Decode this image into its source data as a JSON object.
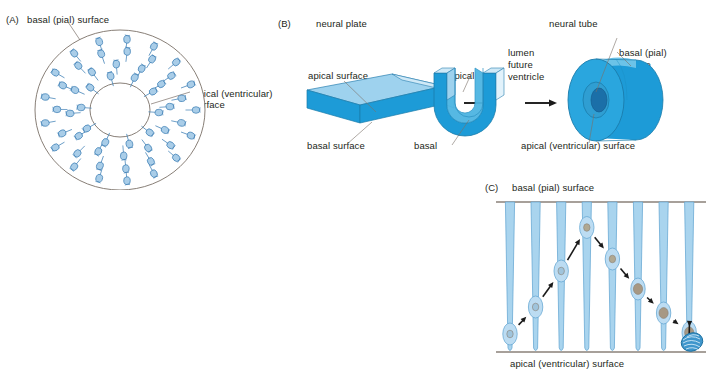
{
  "figure": {
    "background": "#ffffff",
    "width": 714,
    "height": 380
  },
  "colors": {
    "cell_fill": "#a9cde8",
    "cell_stroke": "#3e7fb5",
    "outline_gray": "#7b7068",
    "block_top": "#9ed2ee",
    "block_front": "#1d9bd7",
    "block_side": "#d8ecf8",
    "tube_body": "#1d9bd7",
    "tube_face": "#2aa6de",
    "tube_top": "#6cc3e8",
    "lumen_dark": "#1b6fa8",
    "fiber_fill": "#a9d4ee",
    "fiber_stroke": "#6aa9d4",
    "nucleus_early": "#9fc4dc",
    "nucleus_late": "#a79883",
    "arrow_black": "#1a1a1a",
    "text": "#231f20"
  },
  "panel_a": {
    "tag": "(A)",
    "label_basal": "basal (pial) surface",
    "label_apical_line1": "apical (ventricular)",
    "label_apical_line2": "surface",
    "lumen_line1": "lumen",
    "lumen_line2": "(future",
    "lumen_line3": "ventricle)",
    "cell_count": 48
  },
  "panel_b": {
    "tag": "(B)",
    "title_plate": "neural plate",
    "title_tube": "neural tube",
    "plate_apical": "apical surface",
    "plate_basal": "basal surface",
    "fold_apical": "apical",
    "fold_basal": "basal",
    "tube_lumen_line1": "lumen",
    "tube_lumen_line2": "future",
    "tube_lumen_line3": "ventricle",
    "tube_basal_line1": "basal (pial)",
    "tube_basal_line2": "surface",
    "tube_apical": "apical (ventricular) surface",
    "arrow_1": "arrow-right",
    "arrow_2": "arrow-right"
  },
  "panel_c": {
    "tag": "(C)",
    "label_basal": "basal (pial) surface",
    "label_apical": "apical (ventricular) surface",
    "fiber_count": 8,
    "migration_steps": 8,
    "nuclei_positions": [
      {
        "fiber": 1,
        "height_pct": 88,
        "tone": "early"
      },
      {
        "fiber": 2,
        "height_pct": 70,
        "tone": "early"
      },
      {
        "fiber": 3,
        "height_pct": 46,
        "tone": "early"
      },
      {
        "fiber": 4,
        "height_pct": 17,
        "tone": "mid"
      },
      {
        "fiber": 5,
        "height_pct": 38,
        "tone": "mid"
      },
      {
        "fiber": 6,
        "height_pct": 58,
        "tone": "late"
      },
      {
        "fiber": 7,
        "height_pct": 74,
        "tone": "late"
      },
      {
        "fiber": 8,
        "height_pct": 87,
        "tone": "late"
      }
    ],
    "detached_cell": "migrating-neuron"
  }
}
